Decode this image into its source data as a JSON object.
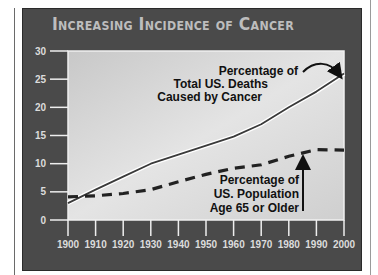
{
  "chart_data": {
    "type": "line",
    "title": "Increasing Incidence of Cancer",
    "xlabel": "",
    "ylabel": "",
    "x": [
      1900,
      1910,
      1920,
      1930,
      1940,
      1950,
      1960,
      1970,
      1980,
      1990,
      2000
    ],
    "xlim": [
      1900,
      2000
    ],
    "ylim": [
      0,
      30
    ],
    "xticks": [
      "1900",
      "1910",
      "1920",
      "1930",
      "1940",
      "1950",
      "1960",
      "1970",
      "1980",
      "1990",
      "2000"
    ],
    "yticks": [
      "0",
      "5",
      "10",
      "15",
      "20",
      "25",
      "30"
    ],
    "grid": false,
    "series": [
      {
        "name": "Percentage of Total US. Deaths Caused by Cancer",
        "style": "solid",
        "values": [
          3.0,
          5.4,
          7.7,
          10.0,
          11.6,
          13.2,
          14.8,
          17.0,
          20.0,
          22.8,
          26.0
        ]
      },
      {
        "name": "Percentage of US. Population Age 65 or Older",
        "style": "dashed",
        "values": [
          4.1,
          4.3,
          4.7,
          5.4,
          6.8,
          8.1,
          9.2,
          9.8,
          11.3,
          12.5,
          12.4
        ]
      }
    ],
    "annotations": [
      {
        "lines": [
          "Percentage of",
          "Total US. Deaths",
          "Caused by Cancer"
        ],
        "points_to": "solid series at 2000"
      },
      {
        "lines": [
          "Percentage of",
          "US. Population",
          "Age 65 or Older"
        ],
        "points_to": "dashed series near 1985"
      }
    ]
  }
}
